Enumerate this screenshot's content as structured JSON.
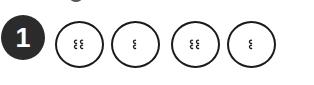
{
  "step": {
    "number": "1",
    "badge_color": "#2b2b2b",
    "number_color": "#ffffff"
  },
  "buttons": [
    {
      "holes": 4,
      "icon": "four-hole-button-icon"
    },
    {
      "holes": 2,
      "icon": "two-hole-button-icon"
    },
    {
      "holes": 4,
      "icon": "four-hole-button-icon"
    },
    {
      "holes": 2,
      "icon": "two-hole-button-icon"
    }
  ],
  "colors": {
    "outline": "#1a1a1a",
    "background": "#ffffff"
  }
}
